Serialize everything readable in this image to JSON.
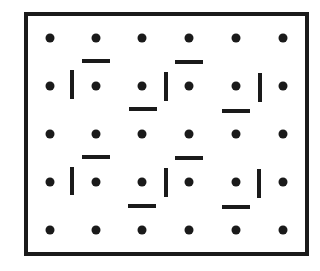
{
  "diagram": {
    "colors": {
      "background": "#ffffff",
      "ink": "#1a1a1a"
    },
    "frame": {
      "x": 26,
      "y": 14,
      "width": 281,
      "height": 240,
      "stroke_width": 4
    },
    "dot_radius": 4.5,
    "grid": {
      "columns_x": [
        50,
        96,
        142,
        189,
        236,
        283
      ],
      "rows_y": [
        38,
        86,
        134,
        182,
        230
      ]
    },
    "bar_thickness": 4,
    "bars": [
      {
        "orientation": "horizontal",
        "x1": 82,
        "y1": 61,
        "x2": 110,
        "y2": 61
      },
      {
        "orientation": "vertical",
        "x1": 72,
        "y1": 70,
        "x2": 72,
        "y2": 99
      },
      {
        "orientation": "vertical",
        "x1": 166,
        "y1": 72,
        "x2": 166,
        "y2": 101
      },
      {
        "orientation": "horizontal",
        "x1": 129,
        "y1": 109,
        "x2": 157,
        "y2": 109
      },
      {
        "orientation": "horizontal",
        "x1": 175,
        "y1": 62,
        "x2": 203,
        "y2": 62
      },
      {
        "orientation": "vertical",
        "x1": 260,
        "y1": 73,
        "x2": 260,
        "y2": 102
      },
      {
        "orientation": "horizontal",
        "x1": 222,
        "y1": 111,
        "x2": 250,
        "y2": 111
      },
      {
        "orientation": "horizontal",
        "x1": 82,
        "y1": 157,
        "x2": 110,
        "y2": 157
      },
      {
        "orientation": "vertical",
        "x1": 72,
        "y1": 167,
        "x2": 72,
        "y2": 195
      },
      {
        "orientation": "vertical",
        "x1": 166,
        "y1": 168,
        "x2": 166,
        "y2": 197
      },
      {
        "orientation": "horizontal",
        "x1": 128,
        "y1": 206,
        "x2": 156,
        "y2": 206
      },
      {
        "orientation": "horizontal",
        "x1": 175,
        "y1": 158,
        "x2": 203,
        "y2": 158
      },
      {
        "orientation": "vertical",
        "x1": 259,
        "y1": 169,
        "x2": 259,
        "y2": 198
      },
      {
        "orientation": "horizontal",
        "x1": 222,
        "y1": 207,
        "x2": 250,
        "y2": 207
      }
    ]
  }
}
